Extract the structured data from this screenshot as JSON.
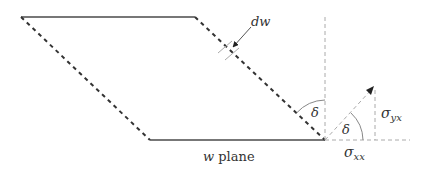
{
  "diagram": {
    "labels": {
      "dw": "dw",
      "delta_left": "δ",
      "delta_right": "δ",
      "sigma_yx": "σ",
      "sigma_yx_sub": "yx",
      "sigma_xx": "σ",
      "sigma_xx_sub": "xx",
      "plane_var": "w",
      "plane_word": " plane"
    },
    "colors": {
      "solid_edge": "#777777",
      "dashed_edge": "#333333",
      "guide": "#aaaaaa",
      "arrow": "#222222"
    }
  }
}
